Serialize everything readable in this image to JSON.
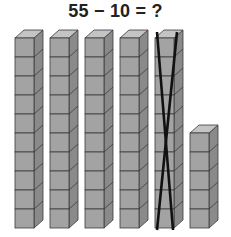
{
  "problem": {
    "equation": "55 − 10 = ?"
  },
  "colors": {
    "front": "#a3a3a3",
    "top": "#c4c4c4",
    "side": "#8a8a8a",
    "edge": "#3a3a3a",
    "cross": "#111111"
  },
  "blocks": {
    "cube_size": 19,
    "depth_x": 9,
    "depth_y": 8,
    "baseline_y": 228,
    "rods": [
      {
        "name": "ten-rod-1",
        "x": 15,
        "cubes": 10,
        "crossed_out": false
      },
      {
        "name": "ten-rod-2",
        "x": 50,
        "cubes": 10,
        "crossed_out": false
      },
      {
        "name": "ten-rod-3",
        "x": 85,
        "cubes": 10,
        "crossed_out": false
      },
      {
        "name": "ten-rod-4",
        "x": 120,
        "cubes": 10,
        "crossed_out": false
      },
      {
        "name": "ten-rod-5",
        "x": 155,
        "cubes": 10,
        "crossed_out": true
      },
      {
        "name": "ones-column",
        "x": 190,
        "cubes": 5,
        "crossed_out": false
      }
    ]
  }
}
